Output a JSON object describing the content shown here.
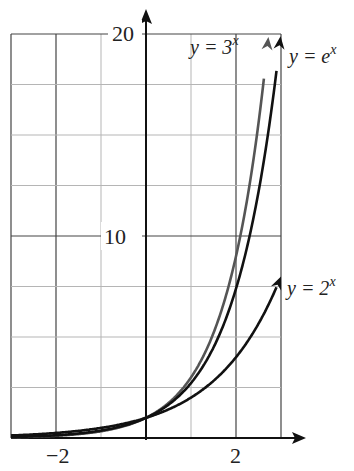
{
  "chart_data": {
    "type": "line",
    "title": "",
    "xlabel": "x",
    "ylabel": "y",
    "xlim": [
      -3,
      3
    ],
    "ylim": [
      0,
      20
    ],
    "grid": true,
    "x_ticks_labeled": [
      -2,
      2
    ],
    "y_ticks_labeled": [
      10,
      20
    ],
    "x_gridlines": [
      -3,
      -2,
      -1,
      0,
      1,
      2,
      3
    ],
    "y_gridlines": [
      0,
      2.5,
      5,
      7.5,
      10,
      12.5,
      15,
      17.5,
      20
    ],
    "tick_labels": {
      "x_neg2": "−2",
      "x_2": "2",
      "y_10": "10",
      "y_20": "20"
    },
    "series": [
      {
        "name": "y = 3^x",
        "label_base": "y = 3",
        "label_exp": "x",
        "function": "3^x",
        "color": "#555555",
        "x_end": 2.72,
        "points": [
          [
            -3,
            0.04
          ],
          [
            -2,
            0.11
          ],
          [
            -1,
            0.33
          ],
          [
            0,
            1
          ],
          [
            1,
            3
          ],
          [
            2,
            9
          ],
          [
            2.5,
            15.6
          ],
          [
            2.72,
            20
          ]
        ]
      },
      {
        "name": "y = e^x",
        "label_base": "y = e",
        "label_exp": "x",
        "function": "e^x",
        "color": "#111111",
        "x_end": 2.99,
        "points": [
          [
            -3,
            0.05
          ],
          [
            -2,
            0.14
          ],
          [
            -1,
            0.37
          ],
          [
            0,
            1
          ],
          [
            1,
            2.72
          ],
          [
            2,
            7.39
          ],
          [
            2.5,
            12.18
          ],
          [
            2.99,
            20
          ]
        ]
      },
      {
        "name": "y = 2^x",
        "label_base": "y = 2",
        "label_exp": "x",
        "function": "2^x",
        "color": "#111111",
        "x_end": 3,
        "points": [
          [
            -3,
            0.125
          ],
          [
            -2,
            0.25
          ],
          [
            -1,
            0.5
          ],
          [
            0,
            1
          ],
          [
            1,
            2
          ],
          [
            2,
            4
          ],
          [
            2.5,
            5.66
          ],
          [
            3,
            8
          ]
        ]
      }
    ],
    "annotations": [
      "All curves pass through (0, 1)"
    ]
  }
}
